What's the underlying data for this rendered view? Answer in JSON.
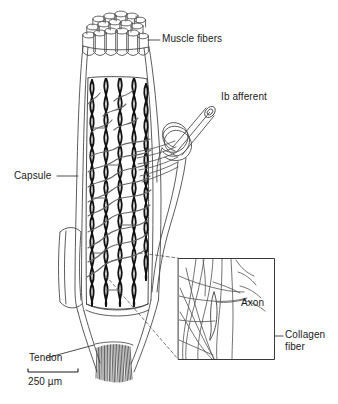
{
  "figure": {
    "background_color": "#ffffff",
    "ink_color": "#1b1b1b",
    "line_color": "#4a4a4a",
    "collagen_color": "#111111",
    "width": 338,
    "height": 404
  },
  "labels": {
    "muscle_fibers": "Muscle fibers",
    "ib_afferent": "Ib afferent",
    "capsule": "Capsule",
    "tendon": "Tendon",
    "axon": "Axon",
    "collagen_fiber_line1": "Collagen",
    "collagen_fiber_line2": "fiber"
  },
  "scale_bar": {
    "value": "250",
    "unit": "µm",
    "text": "250 µm",
    "length_px": 50
  },
  "inset": {
    "name": "magnified-collagen-detail",
    "border_color": "#3a3a3a",
    "x": 178,
    "y": 258,
    "width": 97,
    "height": 102,
    "labels": [
      "Axon",
      "Collagen fiber"
    ]
  },
  "parts": [
    {
      "name": "muscle-fiber-bundle",
      "label": "Muscle fibers",
      "tube_count": 13
    },
    {
      "name": "capsule",
      "label": "Capsule"
    },
    {
      "name": "ib-afferent-nerve",
      "label": "Ib afferent"
    },
    {
      "name": "collagen-braid",
      "label": "Collagen fiber"
    },
    {
      "name": "axon-branches",
      "label": "Axon"
    },
    {
      "name": "tendon",
      "label": "Tendon"
    }
  ]
}
